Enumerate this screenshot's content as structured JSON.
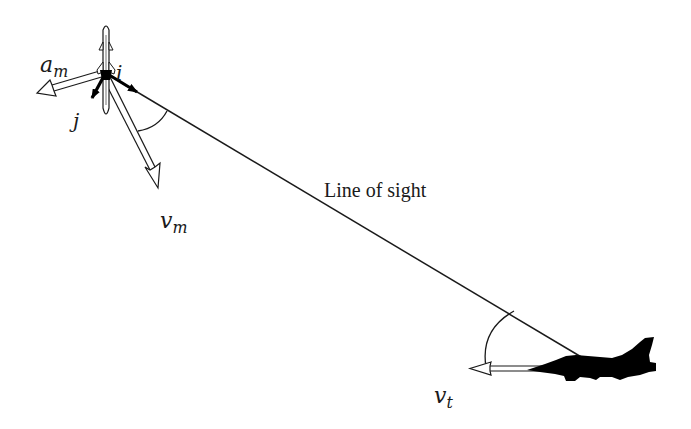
{
  "diagram": {
    "type": "missile-target engagement geometry",
    "labels": {
      "line_of_sight": "Line of sight",
      "missile_accel": {
        "symbol": "a",
        "subscript": "m"
      },
      "missile_vel": {
        "symbol": "v",
        "subscript": "m"
      },
      "target_vel": {
        "symbol": "v",
        "subscript": "t"
      },
      "unit_i": "i",
      "unit_j": "j"
    },
    "elements": [
      "missile",
      "target-aircraft",
      "line-of-sight",
      "missile-velocity-vector",
      "missile-acceleration-vector",
      "unit-vector-i",
      "unit-vector-j",
      "missile-lead-angle-arc",
      "target-aspect-angle-arc",
      "target-velocity-vector"
    ],
    "colors": {
      "background": "#ffffff",
      "stroke": "#1a1a1a",
      "silhouette": "#000000"
    }
  }
}
